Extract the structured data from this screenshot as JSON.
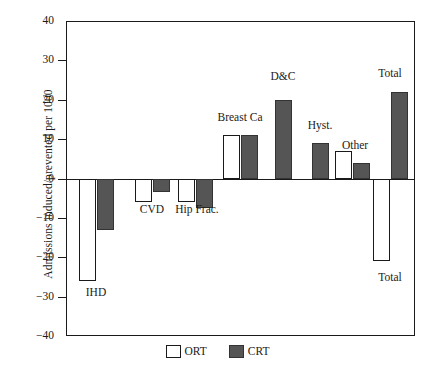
{
  "chart_data": {
    "type": "bar",
    "title": "",
    "xlabel": "",
    "ylabel": "Admissions induced/prevented per 1000",
    "ylim": [
      -40,
      40
    ],
    "yticks": [
      40,
      30,
      20,
      10,
      0,
      -10,
      -20,
      -30,
      -40
    ],
    "ytick_labels": [
      "40",
      "30",
      "20",
      "10",
      "0",
      "−10",
      "−20",
      "−30",
      "−40"
    ],
    "grid": false,
    "legend_position": "bottom-center",
    "categories": [
      "IHD",
      "CVD",
      "Hip Frac.",
      "Breast Ca",
      "D&C",
      "Hyst.",
      "Other",
      "Total"
    ],
    "series": [
      {
        "name": "ORT",
        "color": "#ffffff",
        "values": [
          -26,
          -6,
          -6,
          11,
          null,
          null,
          7,
          -21
        ]
      },
      {
        "name": "CRT",
        "color": "#555555",
        "values": [
          -13,
          -3.5,
          -7.5,
          11,
          20,
          9,
          4,
          22
        ]
      }
    ],
    "annotations": [
      {
        "text": "IHD",
        "category": "IHD",
        "placement": "below"
      },
      {
        "text": "CVD",
        "category": "CVD",
        "placement": "below"
      },
      {
        "text": "Hip Frac.",
        "category": "Hip Frac.",
        "placement": "below"
      },
      {
        "text": "Breast Ca",
        "category": "Breast Ca",
        "placement": "above"
      },
      {
        "text": "D&C",
        "category": "D&C",
        "placement": "above"
      },
      {
        "text": "Hyst.",
        "category": "Hyst.",
        "placement": "above"
      },
      {
        "text": "Other",
        "category": "Other",
        "placement": "above"
      },
      {
        "text": "Total",
        "category": "Total",
        "placement": "above"
      },
      {
        "text": "Total",
        "category": "Total",
        "placement": "below"
      }
    ]
  },
  "legend": {
    "entries": [
      {
        "label": "ORT",
        "color": "#ffffff"
      },
      {
        "label": "CRT",
        "color": "#555555"
      }
    ]
  },
  "colors": {
    "ort_fill": "#ffffff",
    "crt_fill": "#555555",
    "axis": "#1a1a1a",
    "background": "#ffffff"
  }
}
